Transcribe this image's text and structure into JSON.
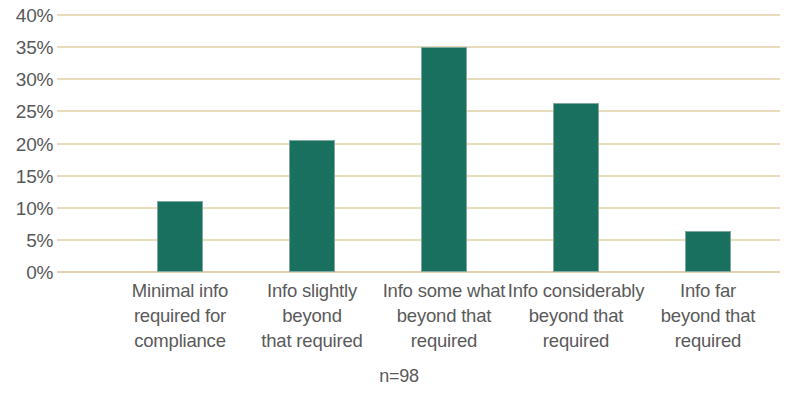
{
  "chart_data": {
    "type": "bar",
    "title": "",
    "subtitle": "",
    "xlabel": "",
    "ylabel": "",
    "ylim": [
      0,
      40
    ],
    "ytick_step": 5,
    "grid": true,
    "legend": null,
    "annotation": "n=98",
    "series_color": "#1a705f",
    "gridline_color": "#e9dcbc",
    "categories": [
      "Minimal info required for compliance",
      "Info slightly beyond that required",
      "Info some what beyond that required",
      "Info considerably beyond that required",
      "Info far beyond that required"
    ],
    "category_lines": [
      [
        "Minimal info",
        "required for",
        "compliance"
      ],
      [
        "Info slightly",
        "beyond",
        "that required"
      ],
      [
        "Info some what",
        "beyond that",
        "required"
      ],
      [
        "Info considerably",
        "beyond that",
        "required"
      ],
      [
        "Info far",
        "beyond that",
        "required"
      ]
    ],
    "values": [
      11.0,
      20.5,
      35.0,
      26.3,
      6.4
    ],
    "ytick_labels": [
      "40%",
      "35%",
      "30%",
      "25%",
      "20%",
      "15%",
      "10%",
      "5%",
      "0%"
    ],
    "ytick_values": [
      40,
      35,
      30,
      25,
      20,
      15,
      10,
      5,
      0
    ]
  }
}
